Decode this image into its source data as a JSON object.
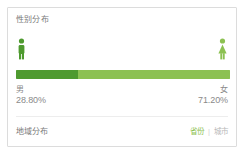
{
  "card": {
    "gender_section": {
      "title": "性别分布",
      "male": {
        "icon": "male-person-icon",
        "label": "男",
        "percent_text": "28.80%",
        "percent": 28.8,
        "color": "#4e9a2f"
      },
      "female": {
        "icon": "female-person-icon",
        "label": "女",
        "percent_text": "71.20%",
        "percent": 71.2,
        "color": "#8cc152"
      }
    },
    "region_section": {
      "title": "地域分布",
      "links": [
        {
          "label": "省份",
          "active": true
        },
        {
          "label": "城市",
          "active": false
        }
      ],
      "separator": "|"
    }
  },
  "chart_data": {
    "type": "bar",
    "orientation": "horizontal-stacked",
    "title": "性别分布",
    "categories": [
      "男",
      "女"
    ],
    "values": [
      28.8,
      71.2
    ],
    "value_labels": [
      "28.80%",
      "71.20%"
    ],
    "colors": [
      "#4e9a2f",
      "#8cc152"
    ],
    "xlabel": "",
    "ylabel": "",
    "ylim": [
      0,
      100
    ],
    "grid": false,
    "legend": "inline-below-bar",
    "unit": "%"
  }
}
